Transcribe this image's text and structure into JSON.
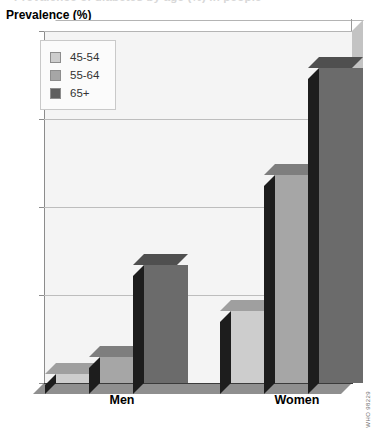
{
  "clipped_title": "Prevalence of diabetes by age (%) in people",
  "axis_title": "Prevalence (%)",
  "legend": {
    "items": [
      {
        "label": "45-54",
        "color": "#cdcdcd"
      },
      {
        "label": "55-64",
        "color": "#a6a6a6"
      },
      {
        "label": "65+",
        "color": "#5e5e5e"
      }
    ]
  },
  "source_credit": "WHO 98229",
  "chart_data": {
    "type": "bar",
    "title": "Prevalence (%)",
    "xlabel": "",
    "ylabel": "Prevalence (%)",
    "categories": [
      "Men",
      "Women"
    ],
    "series": [
      {
        "name": "45-54",
        "color": "#cdcdcd",
        "values": [
          0.5,
          4.1
        ]
      },
      {
        "name": "55-64",
        "color": "#a6a6a6",
        "values": [
          1.5,
          11.8
        ]
      },
      {
        "name": "65+",
        "color": "#6b6b6b",
        "values": [
          6.7,
          17.9
        ]
      }
    ],
    "ylim": [
      0,
      20
    ],
    "yticks": [
      0,
      5,
      10,
      15,
      20
    ],
    "ytick_labels": [
      "0",
      "5",
      "10",
      "15",
      "20"
    ],
    "grid": true,
    "legend_position": "top-left",
    "style": "3d-grayscale"
  }
}
